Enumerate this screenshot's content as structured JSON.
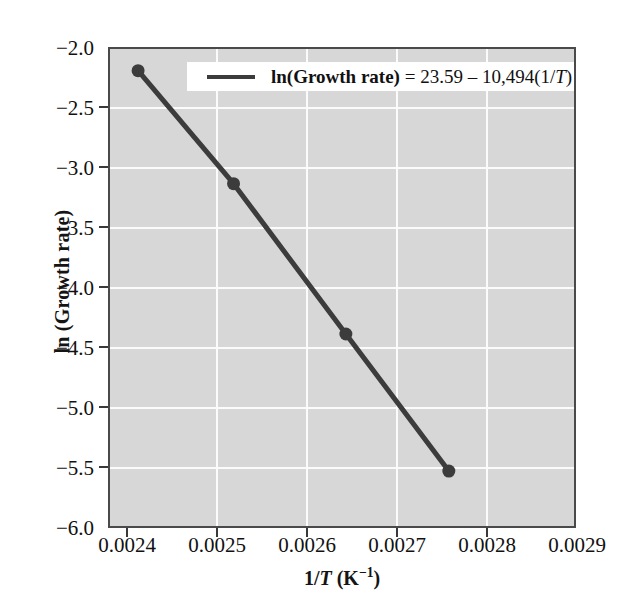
{
  "chart_data": {
    "type": "scatter",
    "title": "",
    "xlabel": "1/T (K⁻¹)",
    "ylabel": "ln (Growth rate)",
    "xlim": [
      0.0024,
      0.0029
    ],
    "ylim": [
      -6.0,
      -2.0
    ],
    "grid": true,
    "legend_position": "top-center",
    "x": [
      0.00243,
      0.002532,
      0.002652,
      0.002762
    ],
    "y": [
      -2.18,
      -3.12,
      -4.37,
      -5.51
    ],
    "series": [
      {
        "name": "ln(Growth rate) = 23.59 – 10,494(1/T)",
        "x": [
          0.00243,
          0.002532,
          0.002652,
          0.002762
        ],
        "values": [
          -2.18,
          -3.12,
          -4.37,
          -5.51
        ],
        "fit_intercept": 23.59,
        "fit_slope": -10494,
        "color": "#3c3c3c",
        "marker": "circle",
        "line": "solid"
      }
    ],
    "xticks": [
      "0.0024",
      "0.0025",
      "0.0026",
      "0.0027",
      "0.0028",
      "0.0029"
    ],
    "xtick_values": [
      0.0024,
      0.0025,
      0.0026,
      0.0027,
      0.0028,
      0.0029
    ],
    "yticks": [
      "−2.0",
      "−2.5",
      "−3.0",
      "−3.5",
      "−4.0",
      "−4.5",
      "−5.0",
      "−5.5",
      "−6.0"
    ],
    "ytick_values": [
      -2.0,
      -2.5,
      -3.0,
      -3.5,
      -4.0,
      -4.5,
      -5.0,
      -5.5,
      -6.0
    ],
    "colors": {
      "plot_background": "#d7d7d7",
      "gridlines": "#fbfbfb",
      "axis": "#4a4a4a",
      "series": "#3c3c3c",
      "text": "#111111",
      "legend_background": "#ffffff"
    }
  },
  "axes": {
    "y_title": "ln (Growth rate)",
    "x_title_prefix": "1/",
    "x_title_var": "T",
    "x_title_units_open": " (K",
    "x_title_exponent": "−1",
    "x_title_units_close": ")",
    "ytick_labels": [
      "−2.0",
      "−2.5",
      "−3.0",
      "−3.5",
      "−4.0",
      "−4.5",
      "−5.0",
      "−5.5",
      "−6.0"
    ],
    "xtick_labels": [
      "0.0024",
      "0.0025",
      "0.0026",
      "0.0027",
      "0.0028",
      "0.0029"
    ]
  },
  "legend": {
    "equation_bold": "ln(Growth rate)",
    "equation_eq": " = 23.59 – 10,494(1/",
    "equation_var": "T",
    "equation_close": ")",
    "full_text": "ln(Growth rate) = 23.59 – 10,494(1/T)"
  }
}
